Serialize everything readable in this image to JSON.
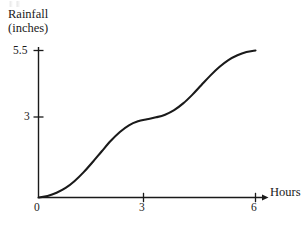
{
  "figure": {
    "background_color": "#ffffff",
    "ink_color": "#1a1a1a"
  },
  "chart_data": {
    "type": "line",
    "title": "",
    "xlabel": "Hours",
    "ylabel": "Rainfall (inches)",
    "ylabel_line1": "Rainfall",
    "ylabel_line2": "(inches)",
    "xlim": [
      0,
      6.35
    ],
    "ylim": [
      0,
      5.85
    ],
    "grid": false,
    "legend": null,
    "xticks": [
      0,
      3,
      6
    ],
    "xtick_labels": [
      "0",
      "3",
      "6"
    ],
    "yticks": [
      3,
      5.5
    ],
    "ytick_labels": [
      "3",
      "5.5"
    ],
    "x_axis_arrow": true,
    "series": [
      {
        "name": "Cumulative rainfall",
        "color": "#1a1a1a",
        "x": [
          0.0,
          0.25,
          0.5,
          0.75,
          1.0,
          1.25,
          1.5,
          1.75,
          2.0,
          2.25,
          2.5,
          2.75,
          3.0,
          3.25,
          3.5,
          3.75,
          4.0,
          4.25,
          4.5,
          4.75,
          5.0,
          5.25,
          5.5,
          5.75,
          6.0
        ],
        "y": [
          0.0,
          0.06,
          0.18,
          0.36,
          0.62,
          0.95,
          1.33,
          1.73,
          2.12,
          2.45,
          2.7,
          2.85,
          2.93,
          3.0,
          3.1,
          3.27,
          3.52,
          3.84,
          4.2,
          4.56,
          4.88,
          5.14,
          5.32,
          5.44,
          5.5
        ]
      }
    ],
    "annotations": []
  },
  "labels": {
    "y_title_line1": "Rainfall",
    "y_title_line2": "(inches)",
    "x_title": "Hours",
    "ytick_top": "5.5",
    "ytick_mid": "3",
    "xtick_0": "0",
    "xtick_3": "3",
    "xtick_6": "6"
  }
}
